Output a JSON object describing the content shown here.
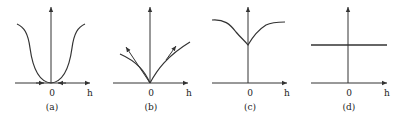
{
  "figure": {
    "panels": [
      {
        "id": "a",
        "caption": "(a)",
        "origin_label": "0",
        "axis_label": "h",
        "description": "U-shaped curve with minimum at origin, flattening to plateaus on both sides; small inward-pointing arrows on h-axis near origin"
      },
      {
        "id": "b",
        "caption": "(b)",
        "origin_label": "0",
        "axis_label": "h",
        "description": "V-shaped curves from origin with tangent arrows pointing outward"
      },
      {
        "id": "c",
        "caption": "(c)",
        "origin_label": "0",
        "axis_label": "h",
        "description": "Inverted-cusp curve with minimum (cusp) on y-axis above origin, rising to plateaus on both sides"
      },
      {
        "id": "d",
        "caption": "(d)",
        "origin_label": "0",
        "axis_label": "h",
        "description": "Horizontal constant line crossing y-axis"
      }
    ]
  },
  "colors": {
    "ink": "#333333",
    "background": "#ffffff"
  }
}
